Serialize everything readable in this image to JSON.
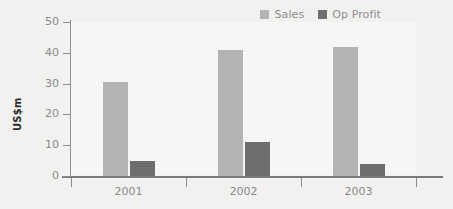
{
  "chart_data": {
    "type": "bar",
    "title": "",
    "subtitle": "",
    "xlabel": "",
    "ylabel": "US$m",
    "categories": [
      "2001",
      "2002",
      "2003"
    ],
    "series": [
      {
        "name": "Sales",
        "color": "#b4b4b4",
        "values": [
          30.5,
          41,
          42
        ]
      },
      {
        "name": "Op Profit",
        "color": "#6e6e6e",
        "values": [
          5,
          11,
          4
        ]
      }
    ],
    "ylim": [
      0,
      50
    ],
    "yticks": [
      0,
      10,
      20,
      30,
      40,
      50
    ],
    "ytick_labels": [
      "0",
      "10",
      "20",
      "30",
      "40",
      "50"
    ],
    "grid": false,
    "legend_position": "top-right"
  },
  "axes": {
    "y_title": "US$m",
    "y_labels": [
      "50",
      "40",
      "30",
      "20",
      "10",
      "0"
    ],
    "x_labels": [
      "2001",
      "2002",
      "2003"
    ]
  },
  "legend": {
    "entries": [
      {
        "label": "Sales",
        "color": "#b4b4b4"
      },
      {
        "label": "Op Profit",
        "color": "#6e6e6e"
      }
    ]
  },
  "colors": {
    "background": "#f1f1ef",
    "plot_background": "#f6f6f4",
    "sales": "#b4b4b4",
    "op_profit": "#6e6e6e",
    "axis": "#8d8d8d",
    "tick_text": "#8a8a8a",
    "title_text": "#2c2c2c"
  }
}
